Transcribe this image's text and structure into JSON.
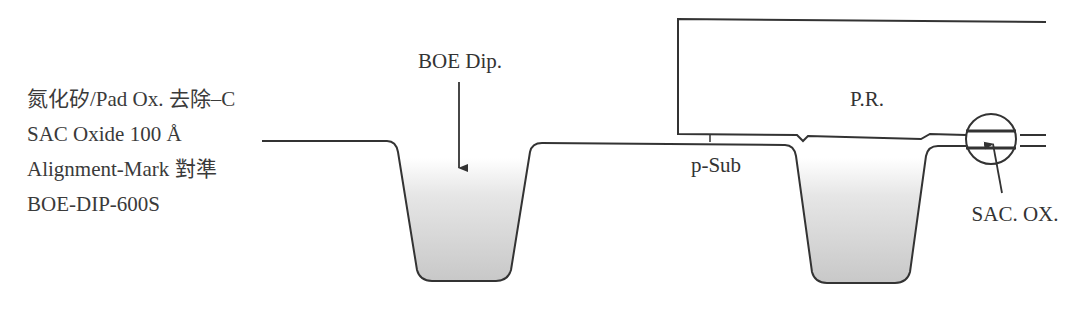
{
  "process_notes": [
    "氮化矽/Pad  Ox. 去除–C",
    "SAC  Oxide  100 Å",
    "Alignment-Mark 對準",
    "BOE-DIP-600S"
  ],
  "labels": {
    "boe_dip": "BOE Dip.",
    "photoresist": "P.R.",
    "substrate": "p-Sub",
    "sac_oxide": "SAC. OX."
  },
  "colors": {
    "line": "#333333",
    "trench_fill_top": "#ffffff",
    "trench_fill_bottom": "#c8c8c8"
  }
}
